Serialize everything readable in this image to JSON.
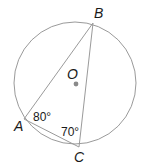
{
  "diagram": {
    "type": "inscribed-triangle-in-circle",
    "circle": {
      "center_label": "O",
      "stroke": "#9a9a9a",
      "center_dot_color": "#8a8a8a"
    },
    "points": {
      "A": {
        "label": "A"
      },
      "B": {
        "label": "B"
      },
      "C": {
        "label": "C"
      }
    },
    "segments": [
      "AB",
      "BC",
      "CA"
    ],
    "angles": {
      "A": {
        "label": "80°",
        "value": 80
      },
      "C": {
        "label": "70°",
        "value": 70
      }
    },
    "line_color": "#9a9a9a"
  }
}
